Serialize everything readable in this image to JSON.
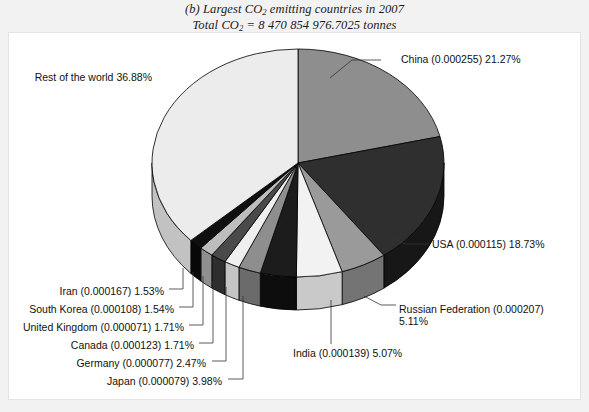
{
  "figure": {
    "title_line1_pre": "(b) Largest CO",
    "title_line1_sub": "2",
    "title_line1_post": " emitting countries in 2007",
    "title_line2_pre": "Total CO",
    "title_line2_sub": "2",
    "title_line2_post": " = 8 470 854 976.7025 tonnes",
    "background_color": "#f2f2f2",
    "panel_color": "#ffffff"
  },
  "chart_data": {
    "type": "pie",
    "title": "(b) Largest CO2 emitting countries in 2007",
    "subtitle": "Total CO2 = 8 470 854 976.7025 tonnes",
    "total_tonnes": "8 470 854 976.7025",
    "units": "tonnes",
    "legend_position": "callout-labels",
    "three_d": true,
    "start_angle_deg": -90,
    "direction": "clockwise",
    "categories": [
      "China",
      "USA",
      "Russian Federation",
      "India",
      "Japan",
      "Germany",
      "Canada",
      "United Kingdom",
      "South Korea",
      "Iran",
      "Rest of the world"
    ],
    "values": [
      21.27,
      18.73,
      5.11,
      5.07,
      3.98,
      2.47,
      1.71,
      1.71,
      1.54,
      1.53,
      36.88
    ],
    "per_capita": [
      "0.000255",
      "0.000115",
      "0.000207",
      "0.000139",
      "0.000079",
      "0.000077",
      "0.000123",
      "0.000071",
      "0.000108",
      "0.000167",
      ""
    ],
    "slice_colors": [
      "#8e8e8e",
      "#2f2f2f",
      "#9a9a9a",
      "#f2f2f2",
      "#1c1c1c",
      "#8e8e8e",
      "#efefef",
      "#4a4a4a",
      "#bdbdbd",
      "#101010",
      "#ececec"
    ],
    "side_colors": [
      "#6b6b6b",
      "#171717",
      "#747474",
      "#c9c9c9",
      "#0d0d0d",
      "#6b6b6b",
      "#c4c4c4",
      "#2e2e2e",
      "#8f8f8f",
      "#080808",
      "#c2c2c2"
    ],
    "labels": [
      {
        "name": "China",
        "text": "China (0.000255) 21.27%",
        "percent": 21.27,
        "side": "right"
      },
      {
        "name": "USA",
        "text": "USA (0.000115) 18.73%",
        "percent": 18.73,
        "side": "right"
      },
      {
        "name": "Russian Federation",
        "text": "Russian Federation (0.000207)",
        "text2": "5.11%",
        "percent": 5.11,
        "side": "right"
      },
      {
        "name": "India",
        "text": "India (0.000139) 5.07%",
        "percent": 5.07,
        "side": "bottom"
      },
      {
        "name": "Japan",
        "text": "Japan (0.000079) 3.98%",
        "percent": 3.98,
        "side": "bottom-left"
      },
      {
        "name": "Germany",
        "text": "Germany (0.000077) 2.47%",
        "percent": 2.47,
        "side": "left"
      },
      {
        "name": "Canada",
        "text": "Canada (0.000123) 1.71%",
        "percent": 1.71,
        "side": "left"
      },
      {
        "name": "United Kingdom",
        "text": "United Kingdom (0.000071) 1.71%",
        "percent": 1.71,
        "side": "left"
      },
      {
        "name": "South Korea",
        "text": "South Korea (0.000108) 1.54%",
        "percent": 1.54,
        "side": "left"
      },
      {
        "name": "Iran",
        "text": "Iran (0.000167) 1.53%",
        "percent": 1.53,
        "side": "left"
      },
      {
        "name": "Rest of the world",
        "text": "Rest of the world 36.88%",
        "percent": 36.88,
        "side": "top-left"
      }
    ]
  },
  "labels": {
    "china": "China (0.000255) 21.27%",
    "usa": "USA (0.000115) 18.73%",
    "russia_l1": "Russian Federation (0.000207)",
    "russia_l2": "5.11%",
    "india": "India (0.000139) 5.07%",
    "japan": "Japan (0.000079) 3.98%",
    "germany": "Germany (0.000077) 2.47%",
    "canada": "Canada (0.000123) 1.71%",
    "uk": "United Kingdom (0.000071) 1.71%",
    "south_korea": "South Korea (0.000108) 1.54%",
    "iran": "Iran (0.000167) 1.53%",
    "rest": "Rest of the world 36.88%"
  }
}
